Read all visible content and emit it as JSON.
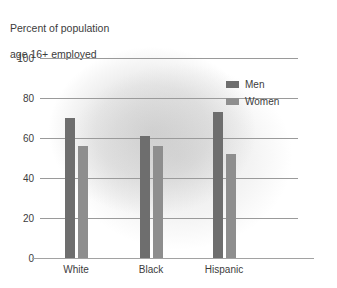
{
  "title": {
    "line1": "Percent of population",
    "line2": "age 16+ employed"
  },
  "legend": {
    "position": "top-right",
    "items": [
      {
        "label": "Men",
        "color": "#6e6e6e",
        "swatch_name": "legend-swatch-men"
      },
      {
        "label": "Women",
        "color": "#8e8e8e",
        "swatch_name": "legend-swatch-women"
      }
    ]
  },
  "axes": {
    "yticks": [
      "0",
      "20",
      "40",
      "60",
      "80",
      "100"
    ],
    "xticks": [
      "White",
      "Black",
      "Hispanic"
    ]
  },
  "chart_data": {
    "type": "bar",
    "title": "Percent of population age 16+ employed",
    "subtitle": "",
    "xlabel": "",
    "ylabel": "Percent of population age 16+ employed",
    "categories": [
      "White",
      "Black",
      "Hispanic"
    ],
    "series": [
      {
        "name": "Men",
        "color": "#6e6e6e",
        "values": [
          70,
          61,
          73
        ]
      },
      {
        "name": "Women",
        "color": "#8e8e8e",
        "values": [
          56,
          56,
          52
        ]
      }
    ],
    "ylim": [
      0,
      100
    ],
    "ytick_values": [
      0,
      20,
      40,
      60,
      80,
      100
    ],
    "grid": "horizontal",
    "legend_position": "top-right"
  }
}
